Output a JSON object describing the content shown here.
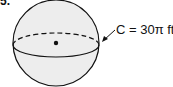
{
  "problem": {
    "number": "5.",
    "figure": "sphere",
    "label": "C = 30π ft",
    "colors": {
      "fill": "#ededed",
      "stroke": "#111111"
    }
  }
}
